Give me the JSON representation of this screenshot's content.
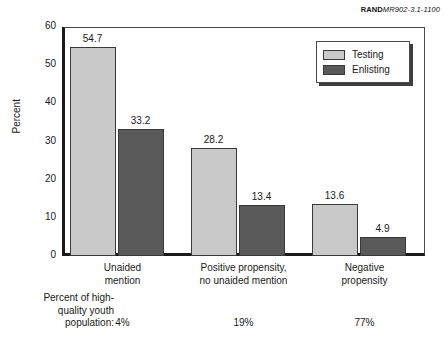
{
  "source_credit": {
    "brand": "RAND",
    "doc_id": "MR902-3.1-1100"
  },
  "chart_data": {
    "type": "bar",
    "title": "",
    "subtitle": "",
    "xlabel": "",
    "ylabel": "Percent",
    "ylim": [
      0,
      60
    ],
    "yticks": [
      0,
      10,
      20,
      30,
      40,
      50,
      60
    ],
    "ytick_labels": [
      "0",
      "10",
      "20",
      "30",
      "40",
      "50",
      "60"
    ],
    "grid": false,
    "legend_position": "top-right-inside",
    "categories": [
      "Unaided\nmention",
      "Positive propensity,\nno unaided mention",
      "Negative\npropensity"
    ],
    "category_lines": [
      [
        "Unaided",
        "mention"
      ],
      [
        "Positive propensity,",
        "no unaided mention"
      ],
      [
        "Negative",
        "propensity"
      ]
    ],
    "series": [
      {
        "name": "Testing",
        "color": "#c9c9c9",
        "values": [
          54.7,
          28.2,
          13.6
        ],
        "labels": [
          "54.7",
          "28.2",
          "13.6"
        ]
      },
      {
        "name": "Enlisting",
        "color": "#595959",
        "values": [
          33.2,
          13.4,
          4.9
        ],
        "labels": [
          "33.2",
          "13.4",
          "4.9"
        ]
      }
    ],
    "annotations": {
      "footnote_label_lines": [
        "Percent of high-",
        "quality youth",
        "population:"
      ],
      "footnote_values": [
        "4%",
        "19%",
        "77%"
      ]
    }
  }
}
